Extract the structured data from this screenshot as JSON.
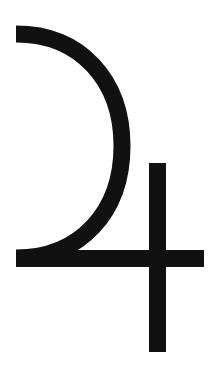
{
  "image": {
    "subject": "Jupiter symbol",
    "glyph": "♃",
    "background_color": "#ffffff",
    "stroke_color": "#111111"
  }
}
